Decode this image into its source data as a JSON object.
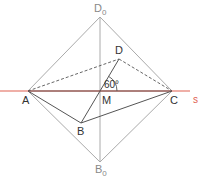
{
  "diagram": {
    "colors": {
      "construction": "#aaaaaa",
      "main": "#555555",
      "dashed": "#555555",
      "line_s": "#e06050",
      "label": "#333333",
      "label_light": "#888888",
      "label_s": "#e06050"
    },
    "points": {
      "A": {
        "label": "A",
        "x": 28,
        "y": 91
      },
      "C": {
        "label": "C",
        "x": 172,
        "y": 91
      },
      "M": {
        "label": "M",
        "x": 100,
        "y": 91
      },
      "D": {
        "label": "D",
        "x": 119,
        "y": 59
      },
      "B": {
        "label": "B",
        "x": 81,
        "y": 123
      },
      "D0": {
        "label": "D",
        "sub": "0",
        "x": 100,
        "y": 17
      },
      "B0": {
        "label": "B",
        "sub": "0",
        "x": 100,
        "y": 162
      }
    },
    "line_s": {
      "label": "s"
    },
    "angle": {
      "label": "60°"
    }
  }
}
